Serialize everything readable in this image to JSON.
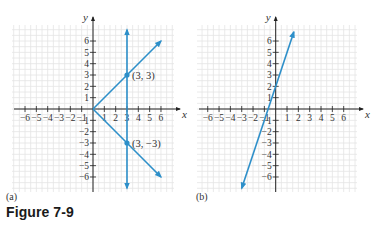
{
  "figure": {
    "caption": "Figure 7-9",
    "line_color": "#2d8fc9"
  },
  "chart_data": [
    {
      "type": "line",
      "panel_label": "(a)",
      "xlabel": "x",
      "ylabel": "y",
      "xlim": [
        -7,
        7
      ],
      "ylim": [
        -7,
        7
      ],
      "grid": true,
      "x_ticks": [
        -6,
        -5,
        -4,
        -3,
        -2,
        -1,
        1,
        2,
        3,
        4,
        5,
        6
      ],
      "y_ticks": [
        6,
        5,
        4,
        3,
        2,
        1,
        -1,
        -2,
        -3,
        -4,
        -5,
        -6
      ],
      "series": [
        {
          "name": "y = x (x ≥ 0)",
          "points": [
            [
              0,
              0
            ],
            [
              6,
              6
            ]
          ],
          "arrow_end": true
        },
        {
          "name": "y = -x (x ≥ 0)",
          "points": [
            [
              0,
              0
            ],
            [
              6,
              -6
            ]
          ],
          "arrow_end": true
        },
        {
          "name": "x = 3",
          "points": [
            [
              3,
              -7
            ],
            [
              3,
              7
            ]
          ],
          "arrow_both": true
        }
      ],
      "annotations": [
        {
          "point": [
            3,
            3
          ],
          "label": "(3, 3)"
        },
        {
          "point": [
            3,
            -3
          ],
          "label": "(3, −3)"
        }
      ]
    },
    {
      "type": "line",
      "panel_label": "(b)",
      "xlabel": "x",
      "ylabel": "y",
      "xlim": [
        -7,
        7
      ],
      "ylim": [
        -7,
        7
      ],
      "grid": true,
      "x_ticks": [
        -6,
        -5,
        -4,
        -3,
        -2,
        -1,
        1,
        2,
        3,
        4,
        5,
        6
      ],
      "y_ticks": [
        6,
        5,
        4,
        3,
        2,
        1,
        -1,
        -2,
        -3,
        -4,
        -5,
        -6
      ],
      "series": [
        {
          "name": "y = 3x + 2",
          "points": [
            [
              -3,
              -7
            ],
            [
              1.6,
              6.8
            ]
          ],
          "arrow_both": true
        }
      ],
      "annotations": []
    }
  ]
}
